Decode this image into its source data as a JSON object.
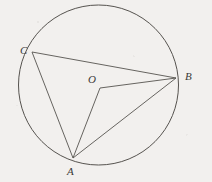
{
  "figure": {
    "background_color": "#f2f0ee",
    "stroke_color": "#56534f",
    "label_color": "#3b3a38",
    "canvas": {
      "width": 212,
      "height": 182
    }
  },
  "circle": {
    "name": "main-circle",
    "cx": 98.5,
    "cy": 85,
    "r": 80,
    "stroke_width": 1
  },
  "points": [
    {
      "id": "C",
      "label": "C",
      "x": 32,
      "y": 52,
      "label_x": 20,
      "label_y": 45
    },
    {
      "id": "B",
      "label": "B",
      "x": 176,
      "y": 78,
      "label_x": 185,
      "label_y": 71
    },
    {
      "id": "A",
      "label": "A",
      "x": 73,
      "y": 158,
      "label_x": 67,
      "label_y": 166
    },
    {
      "id": "O",
      "label": "O",
      "x": 100,
      "y": 88,
      "label_x": 88,
      "label_y": 74
    }
  ],
  "segments": [
    {
      "name": "segment-CB",
      "from": "C",
      "to": "B",
      "x1": 32,
      "y1": 52,
      "x2": 176,
      "y2": 78
    },
    {
      "name": "segment-CA",
      "from": "C",
      "to": "A",
      "x1": 32,
      "y1": 52,
      "x2": 73,
      "y2": 158
    },
    {
      "name": "segment-OB",
      "from": "O",
      "to": "B",
      "x1": 100,
      "y1": 88,
      "x2": 176,
      "y2": 78
    },
    {
      "name": "segment-OA",
      "from": "O",
      "to": "A",
      "x1": 100,
      "y1": 88,
      "x2": 73,
      "y2": 158
    },
    {
      "name": "segment-AB",
      "from": "A",
      "to": "B",
      "x1": 73,
      "y1": 158,
      "x2": 176,
      "y2": 78
    }
  ],
  "labels": {
    "c": "C",
    "b": "B",
    "a": "A",
    "o": "O"
  }
}
